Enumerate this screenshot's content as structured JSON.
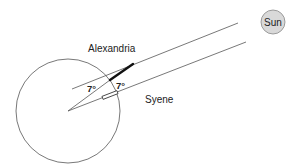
{
  "diagram": {
    "labels": {
      "sun": "Sun",
      "alexandria": "Alexandria",
      "syene": "Syene",
      "angle_center": "7°",
      "angle_gnomon": "7°"
    },
    "colors": {
      "line": "#555555",
      "gnomon": "#111111",
      "sun_fill": "#d9d9d9",
      "sun_stroke": "#888888",
      "text": "#222222"
    },
    "geometry": {
      "earth": {
        "cx": 68,
        "cy": 111,
        "r": 52
      },
      "sun": {
        "cx": 273,
        "cy": 22,
        "r": 12
      },
      "sun_ray_upper": {
        "x1": 72,
        "y1": 89,
        "x2": 238,
        "y2": 23
      },
      "sun_ray_lower": {
        "x1": 68,
        "y1": 111,
        "x2": 246,
        "y2": 42
      },
      "radial_alexandria": {
        "x1": 68,
        "y1": 111,
        "x2": 110,
        "y2": 80
      },
      "gnomon": {
        "x1": 110,
        "y1": 80,
        "x2": 133,
        "y2": 64
      }
    }
  }
}
